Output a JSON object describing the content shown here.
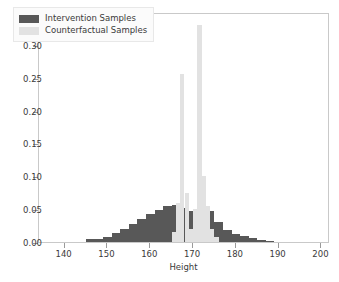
{
  "chart_data": {
    "type": "bar",
    "title": "",
    "xlabel": "Height",
    "ylabel": "",
    "xlim": [
      134,
      202
    ],
    "ylim": [
      0.0,
      0.35
    ],
    "grid": false,
    "legend_position": "upper left",
    "xticks": [
      140,
      150,
      160,
      170,
      180,
      190,
      200
    ],
    "xtick_labels": [
      "140",
      "150",
      "160",
      "170",
      "180",
      "190",
      "200"
    ],
    "yticks": [
      0.0,
      0.05,
      0.1,
      0.15,
      0.2,
      0.25,
      0.3,
      0.35
    ],
    "ytick_labels": [
      "0.00",
      "0.05",
      "0.10",
      "0.15",
      "0.20",
      "0.25",
      "0.30",
      "0.35"
    ],
    "series": [
      {
        "name": "Intervention Samples",
        "color": "#585858",
        "bin_width": 2,
        "bins": [
          145,
          147,
          149,
          151,
          153,
          155,
          157,
          159,
          161,
          163,
          165,
          167,
          169,
          171,
          173,
          175,
          177,
          179,
          181,
          183,
          185,
          187
        ],
        "values": [
          0.004,
          0.005,
          0.008,
          0.013,
          0.02,
          0.028,
          0.035,
          0.042,
          0.049,
          0.055,
          0.057,
          0.052,
          0.047,
          0.041,
          0.047,
          0.03,
          0.018,
          0.012,
          0.009,
          0.006,
          0.003,
          0.002
        ]
      },
      {
        "name": "Counterfactual Samples",
        "color": "#e2e2e2",
        "bin_width": 1,
        "bins": [
          165,
          166,
          167,
          168,
          169,
          170,
          171,
          172,
          173,
          174,
          175
        ],
        "values": [
          0.015,
          0.06,
          0.255,
          0.075,
          0.02,
          0.05,
          0.33,
          0.1,
          0.055,
          0.02,
          0.008
        ]
      }
    ]
  },
  "legend": {
    "items": [
      {
        "label": "Intervention Samples",
        "color": "#585858"
      },
      {
        "label": "Counterfactual Samples",
        "color": "#e2e2e2"
      }
    ]
  },
  "axes": {
    "xlabel": "Height"
  }
}
